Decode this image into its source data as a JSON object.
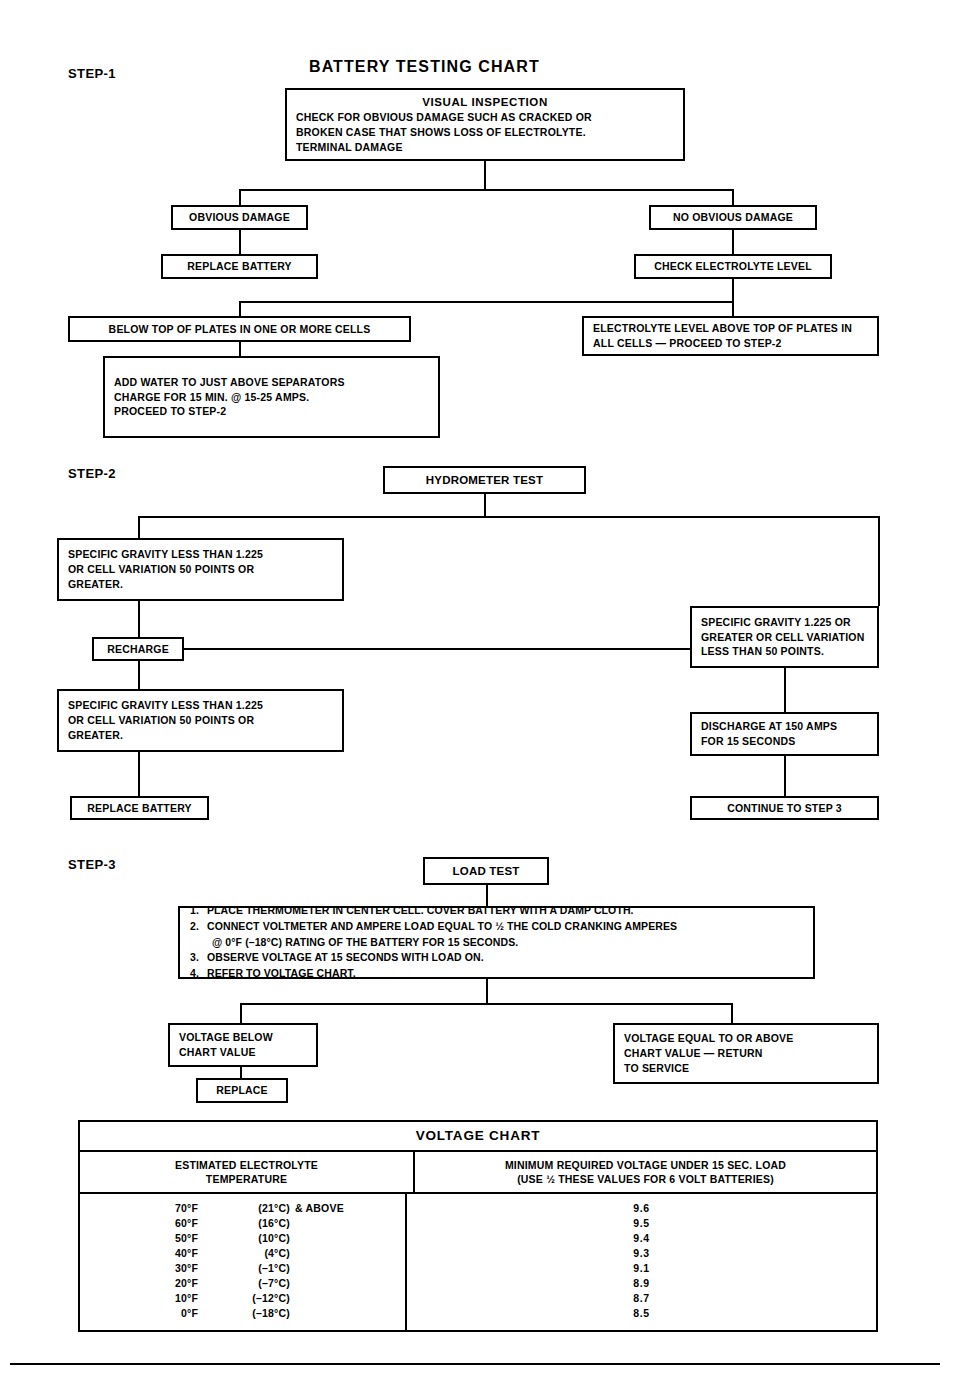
{
  "chart_title": "BATTERY TESTING CHART",
  "steps": {
    "step1": {
      "label": "STEP-1"
    },
    "step2": {
      "label": "STEP-2"
    },
    "step3": {
      "label": "STEP-3"
    }
  },
  "step1_nodes": {
    "visual_inspection": {
      "heading": "VISUAL INSPECTION",
      "line1": "CHECK FOR OBVIOUS DAMAGE SUCH AS CRACKED OR",
      "line2": "BROKEN CASE THAT SHOWS LOSS OF ELECTROLYTE.",
      "line3": "TERMINAL DAMAGE"
    },
    "obvious_damage": "OBVIOUS DAMAGE",
    "replace_battery": "REPLACE BATTERY",
    "no_obvious_damage": "NO OBVIOUS DAMAGE",
    "check_electrolyte_level": "CHECK ELECTROLYTE LEVEL",
    "below_top_of_plates": "BELOW TOP OF PLATES IN ONE OR MORE CELLS",
    "electrolyte_above": {
      "line1": "ELECTROLYTE LEVEL ABOVE TOP OF PLATES IN",
      "line2": "ALL CELLS — PROCEED TO STEP-2"
    },
    "add_water": {
      "line1": "ADD WATER TO JUST ABOVE SEPARATORS",
      "line2": "CHARGE FOR 15 MIN. @ 15-25 AMPS.",
      "line3": "PROCEED TO STEP-2"
    }
  },
  "step2_nodes": {
    "hydrometer_test": "HYDROMETER TEST",
    "low_gravity_1": {
      "line1": "SPECIFIC GRAVITY LESS THAN 1.225",
      "line2": "OR CELL VARIATION 50 POINTS OR",
      "line3": "GREATER."
    },
    "good_gravity": {
      "line1": "SPECIFIC GRAVITY 1.225 OR",
      "line2": "GREATER OR CELL VARIATION",
      "line3": "LESS THAN 50 POINTS."
    },
    "recharge": "RECHARGE",
    "low_gravity_2": {
      "line1": "SPECIFIC GRAVITY LESS THAN 1.225",
      "line2": "OR CELL VARIATION 50 POINTS OR",
      "line3": "GREATER."
    },
    "discharge": {
      "line1": "DISCHARGE AT 150 AMPS",
      "line2": "FOR 15 SECONDS"
    },
    "replace_battery": "REPLACE BATTERY",
    "continue_step3": "CONTINUE TO STEP 3"
  },
  "step3_nodes": {
    "load_test": "LOAD TEST",
    "instructions": [
      {
        "num": "1.",
        "text": "PLACE THERMOMETER IN CENTER CELL. COVER BATTERY WITH A DAMP CLOTH.",
        "cont": ""
      },
      {
        "num": "2.",
        "text": "CONNECT VOLTMETER AND AMPERE LOAD EQUAL TO ½ THE COLD CRANKING AMPERES",
        "cont": "@ 0°F (–18°C) RATING OF THE BATTERY FOR 15 SECONDS."
      },
      {
        "num": "3.",
        "text": "OBSERVE VOLTAGE AT 15 SECONDS WITH LOAD ON.",
        "cont": ""
      },
      {
        "num": "4.",
        "text": "REFER TO VOLTAGE CHART.",
        "cont": ""
      }
    ],
    "voltage_below": {
      "line1": "VOLTAGE BELOW",
      "line2": "CHART VALUE"
    },
    "replace": "REPLACE",
    "voltage_ok": {
      "line1": "VOLTAGE EQUAL TO OR ABOVE",
      "line2": "CHART VALUE — RETURN",
      "line3": "TO SERVICE"
    }
  },
  "chart_data": {
    "type": "table",
    "title": "VOLTAGE CHART",
    "columns": [
      {
        "line1": "ESTIMATED ELECTROLYTE",
        "line2": "TEMPERATURE"
      },
      {
        "line1": "MINIMUM REQUIRED VOLTAGE UNDER 15 SEC. LOAD",
        "line2": "(USE ½ THESE VALUES FOR 6 VOLT BATTERIES)"
      }
    ],
    "categories": [
      "70°F",
      "60°F",
      "50°F",
      "40°F",
      "30°F",
      "20°F",
      "10°F",
      "0°F"
    ],
    "values": [
      9.6,
      9.5,
      9.4,
      9.3,
      9.1,
      8.9,
      8.7,
      8.5
    ],
    "xlabel": "ESTIMATED ELECTROLYTE TEMPERATURE",
    "ylabel": "MINIMUM REQUIRED VOLTAGE UNDER 15 SEC. LOAD",
    "rows": [
      {
        "f": "70°F",
        "c": "(21°C)",
        "extra": "& ABOVE",
        "v": "9.6"
      },
      {
        "f": "60°F",
        "c": "(16°C)",
        "extra": "",
        "v": "9.5"
      },
      {
        "f": "50°F",
        "c": "(10°C)",
        "extra": "",
        "v": "9.4"
      },
      {
        "f": "40°F",
        "c": "(4°C)",
        "extra": "",
        "v": "9.3"
      },
      {
        "f": "30°F",
        "c": "(–1°C)",
        "extra": "",
        "v": "9.1"
      },
      {
        "f": "20°F",
        "c": "(–7°C)",
        "extra": "",
        "v": "8.9"
      },
      {
        "f": "10°F",
        "c": "(–12°C)",
        "extra": "",
        "v": "8.7"
      },
      {
        "f": "0°F",
        "c": "(–18°C)",
        "extra": "",
        "v": "8.5"
      }
    ]
  }
}
